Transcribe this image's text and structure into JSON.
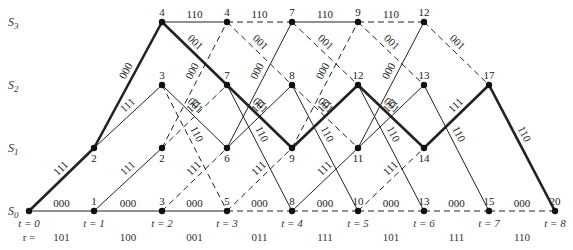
{
  "diagram": {
    "type": "trellis",
    "title": "",
    "states": [
      {
        "id": "S0",
        "label": "S",
        "sub": "0",
        "y": 211
      },
      {
        "id": "S1",
        "label": "S",
        "sub": "1",
        "y": 148
      },
      {
        "id": "S2",
        "label": "S",
        "sub": "2",
        "y": 85
      },
      {
        "id": "S3",
        "label": "S",
        "sub": "3",
        "y": 22
      }
    ],
    "time_x": [
      29,
      94,
      162,
      227,
      292,
      358,
      424,
      489,
      555
    ],
    "time_labels": [
      "t = 0",
      "t = 1",
      "t = 2",
      "t = 3",
      "t = 4",
      "t = 5",
      "t = 6",
      "t = 7",
      "t = 8"
    ],
    "r_prefix": "r =",
    "received": [
      "101",
      "100",
      "001",
      "011",
      "111",
      "101",
      "111",
      "110"
    ],
    "nodes": [
      {
        "t": 0,
        "s": 0,
        "metric": ""
      },
      {
        "t": 1,
        "s": 0,
        "metric": "1"
      },
      {
        "t": 1,
        "s": 1,
        "metric": "2"
      },
      {
        "t": 2,
        "s": 0,
        "metric": "3"
      },
      {
        "t": 2,
        "s": 1,
        "metric": "2"
      },
      {
        "t": 2,
        "s": 2,
        "metric": "3"
      },
      {
        "t": 2,
        "s": 3,
        "metric": "4"
      },
      {
        "t": 3,
        "s": 0,
        "metric": "5"
      },
      {
        "t": 3,
        "s": 1,
        "metric": "6"
      },
      {
        "t": 3,
        "s": 2,
        "metric": "7"
      },
      {
        "t": 3,
        "s": 3,
        "metric": "4"
      },
      {
        "t": 4,
        "s": 0,
        "metric": "8"
      },
      {
        "t": 4,
        "s": 1,
        "metric": "9"
      },
      {
        "t": 4,
        "s": 2,
        "metric": "8"
      },
      {
        "t": 4,
        "s": 3,
        "metric": "7"
      },
      {
        "t": 5,
        "s": 0,
        "metric": "10"
      },
      {
        "t": 5,
        "s": 1,
        "metric": "11"
      },
      {
        "t": 5,
        "s": 2,
        "metric": "12"
      },
      {
        "t": 5,
        "s": 3,
        "metric": "9"
      },
      {
        "t": 6,
        "s": 0,
        "metric": "13"
      },
      {
        "t": 6,
        "s": 1,
        "metric": "14"
      },
      {
        "t": 6,
        "s": 2,
        "metric": "13"
      },
      {
        "t": 6,
        "s": 3,
        "metric": "12"
      },
      {
        "t": 7,
        "s": 0,
        "metric": "15"
      },
      {
        "t": 7,
        "s": 2,
        "metric": "17"
      },
      {
        "t": 8,
        "s": 0,
        "metric": "20"
      }
    ],
    "edges": [
      {
        "t": 0,
        "from": 0,
        "to": 0,
        "label": "000",
        "style": "solid",
        "weight": "thin"
      },
      {
        "t": 0,
        "from": 0,
        "to": 1,
        "label": "111",
        "style": "solid",
        "weight": "thick"
      },
      {
        "t": 1,
        "from": 0,
        "to": 0,
        "label": "000",
        "style": "solid",
        "weight": "thin"
      },
      {
        "t": 1,
        "from": 0,
        "to": 1,
        "label": "111",
        "style": "solid",
        "weight": "thin"
      },
      {
        "t": 1,
        "from": 1,
        "to": 2,
        "label": "111",
        "style": "solid",
        "weight": "thin"
      },
      {
        "t": 1,
        "from": 1,
        "to": 3,
        "label": "000",
        "style": "solid",
        "weight": "thick"
      },
      {
        "t": 2,
        "from": 0,
        "to": 0,
        "label": "000",
        "style": "solid",
        "weight": "thin"
      },
      {
        "t": 2,
        "from": 0,
        "to": 1,
        "label": "111",
        "style": "dashed",
        "weight": "thin"
      },
      {
        "t": 2,
        "from": 1,
        "to": 2,
        "label": "111",
        "style": "dashed",
        "weight": "thin"
      },
      {
        "t": 2,
        "from": 1,
        "to": 3,
        "label": "000",
        "style": "dashed",
        "weight": "thin"
      },
      {
        "t": 2,
        "from": 2,
        "to": 0,
        "label": "110",
        "style": "dashed",
        "weight": "thin"
      },
      {
        "t": 2,
        "from": 2,
        "to": 1,
        "label": "001",
        "style": "solid",
        "weight": "thin"
      },
      {
        "t": 2,
        "from": 3,
        "to": 2,
        "label": "001",
        "style": "solid",
        "weight": "thick"
      },
      {
        "t": 2,
        "from": 3,
        "to": 3,
        "label": "110",
        "style": "solid",
        "weight": "thin"
      },
      {
        "t": 3,
        "from": 0,
        "to": 0,
        "label": "000",
        "style": "dashed",
        "weight": "thin"
      },
      {
        "t": 3,
        "from": 0,
        "to": 1,
        "label": "111",
        "style": "dashed",
        "weight": "thin"
      },
      {
        "t": 3,
        "from": 1,
        "to": 2,
        "label": "111",
        "style": "solid",
        "weight": "thin"
      },
      {
        "t": 3,
        "from": 1,
        "to": 3,
        "label": "000",
        "style": "solid",
        "weight": "thin"
      },
      {
        "t": 3,
        "from": 2,
        "to": 0,
        "label": "110",
        "style": "solid",
        "weight": "thin"
      },
      {
        "t": 3,
        "from": 2,
        "to": 1,
        "label": "001",
        "style": "solid",
        "weight": "thick"
      },
      {
        "t": 3,
        "from": 3,
        "to": 2,
        "label": "001",
        "style": "dashed",
        "weight": "thin"
      },
      {
        "t": 3,
        "from": 3,
        "to": 3,
        "label": "110",
        "style": "dashed",
        "weight": "thin"
      },
      {
        "t": 4,
        "from": 0,
        "to": 0,
        "label": "000",
        "style": "dashed",
        "weight": "thin"
      },
      {
        "t": 4,
        "from": 0,
        "to": 1,
        "label": "111",
        "style": "solid",
        "weight": "thin"
      },
      {
        "t": 4,
        "from": 1,
        "to": 2,
        "label": "111",
        "style": "solid",
        "weight": "thick"
      },
      {
        "t": 4,
        "from": 1,
        "to": 3,
        "label": "000",
        "style": "dashed",
        "weight": "thin"
      },
      {
        "t": 4,
        "from": 2,
        "to": 0,
        "label": "110",
        "style": "solid",
        "weight": "thin"
      },
      {
        "t": 4,
        "from": 2,
        "to": 1,
        "label": "001",
        "style": "dashed",
        "weight": "thin"
      },
      {
        "t": 4,
        "from": 3,
        "to": 2,
        "label": "001",
        "style": "dashed",
        "weight": "thin"
      },
      {
        "t": 4,
        "from": 3,
        "to": 3,
        "label": "110",
        "style": "solid",
        "weight": "thin"
      },
      {
        "t": 5,
        "from": 0,
        "to": 0,
        "label": "000",
        "style": "dashed",
        "weight": "thin"
      },
      {
        "t": 5,
        "from": 0,
        "to": 1,
        "label": "111",
        "style": "dashed",
        "weight": "thin"
      },
      {
        "t": 5,
        "from": 1,
        "to": 2,
        "label": "111",
        "style": "solid",
        "weight": "thin"
      },
      {
        "t": 5,
        "from": 1,
        "to": 3,
        "label": "000",
        "style": "solid",
        "weight": "thin"
      },
      {
        "t": 5,
        "from": 2,
        "to": 0,
        "label": "110",
        "style": "solid",
        "weight": "thin"
      },
      {
        "t": 5,
        "from": 2,
        "to": 1,
        "label": "001",
        "style": "solid",
        "weight": "thick"
      },
      {
        "t": 5,
        "from": 3,
        "to": 2,
        "label": "001",
        "style": "dashed",
        "weight": "thin"
      },
      {
        "t": 5,
        "from": 3,
        "to": 3,
        "label": "110",
        "style": "dashed",
        "weight": "thin"
      },
      {
        "t": 6,
        "from": 0,
        "to": 0,
        "label": "000",
        "style": "dashed",
        "weight": "thin"
      },
      {
        "t": 6,
        "from": 1,
        "to": 2,
        "label": "111",
        "style": "solid",
        "weight": "thick"
      },
      {
        "t": 6,
        "from": 2,
        "to": 0,
        "label": "110",
        "style": "solid",
        "weight": "thin"
      },
      {
        "t": 6,
        "from": 3,
        "to": 2,
        "label": "001",
        "style": "dashed",
        "weight": "thin"
      },
      {
        "t": 7,
        "from": 0,
        "to": 0,
        "label": "000",
        "style": "dashed",
        "weight": "thin"
      },
      {
        "t": 7,
        "from": 2,
        "to": 0,
        "label": "110",
        "style": "solid",
        "weight": "thick"
      }
    ]
  }
}
